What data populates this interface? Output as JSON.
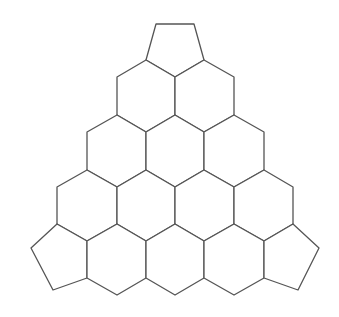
{
  "diagram": {
    "stroke_color": "#555555",
    "fill_color": "#ffffff",
    "background": "#ffffff",
    "rows": [
      {
        "row": 1,
        "cells": [
          {
            "id": "pent-top",
            "shape": "pentagon",
            "points": "156,24 194,24 204,60 175,77 146,60"
          }
        ]
      },
      {
        "row": 2,
        "cells": [
          {
            "id": "hex-2-1",
            "shape": "hexagon",
            "points": "146,60 175,77 175,115 146,132 117,115 117,77"
          },
          {
            "id": "hex-2-2",
            "shape": "hexagon",
            "points": "204,60 234,77 234,115 204,132 175,115 175,77"
          }
        ]
      },
      {
        "row": 3,
        "cells": [
          {
            "id": "hex-3-1",
            "shape": "hexagon",
            "points": "117,115 146,132 146,170 117,187 87,170 87,132"
          },
          {
            "id": "hex-3-2",
            "shape": "hexagon",
            "points": "175,115 204,132 204,170 175,187 146,170 146,132"
          },
          {
            "id": "hex-3-3",
            "shape": "hexagon",
            "points": "234,115 264,132 264,170 234,187 204,170 204,132"
          }
        ]
      },
      {
        "row": 4,
        "cells": [
          {
            "id": "hex-4-1",
            "shape": "hexagon",
            "points": "87,170 117,187 117,224 87,241 57,224 57,187"
          },
          {
            "id": "hex-4-2",
            "shape": "hexagon",
            "points": "146,170 175,187 175,224 146,241 117,224 117,187"
          },
          {
            "id": "hex-4-3",
            "shape": "hexagon",
            "points": "204,170 234,187 234,224 204,241 175,224 175,187"
          },
          {
            "id": "hex-4-4",
            "shape": "hexagon",
            "points": "264,170 293,187 293,224 264,241 234,224 234,187"
          }
        ]
      },
      {
        "row": 5,
        "cells": [
          {
            "id": "pent-bottom-left",
            "shape": "pentagon",
            "points": "57,224 87,241 87,278 53,290 31,248"
          },
          {
            "id": "hex-5-1",
            "shape": "hexagon",
            "points": "117,224 146,241 146,278 117,295 87,278 87,241"
          },
          {
            "id": "hex-5-2",
            "shape": "hexagon",
            "points": "175,224 204,241 204,278 175,295 146,278 146,241"
          },
          {
            "id": "hex-5-3",
            "shape": "hexagon",
            "points": "234,224 264,241 264,278 234,295 204,278 204,241"
          },
          {
            "id": "pent-bottom-right",
            "shape": "pentagon",
            "points": "293,224 319,248 298,290 264,278 264,241"
          }
        ]
      }
    ]
  }
}
